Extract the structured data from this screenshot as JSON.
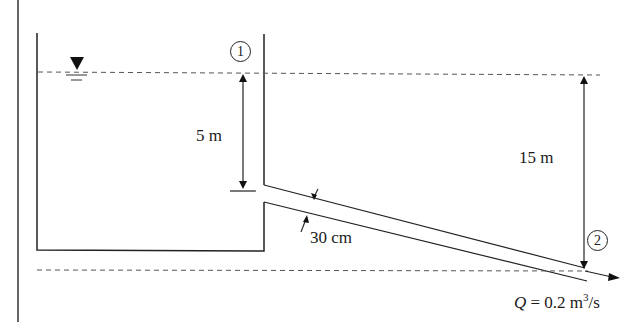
{
  "diagram": {
    "points": [
      {
        "id": "1",
        "label": "1"
      },
      {
        "id": "2",
        "label": "2"
      }
    ],
    "dimensions": {
      "entrance_depth": "5 m",
      "total_head": "15 m",
      "pipe_diameter": "30 cm"
    },
    "flow": {
      "symbol": "Q",
      "equals": " = 0.2 m",
      "exponent": "3",
      "unit_tail": "/s"
    },
    "colors": {
      "line": "#222222",
      "dashed": "#555555",
      "background": "#ffffff"
    }
  }
}
